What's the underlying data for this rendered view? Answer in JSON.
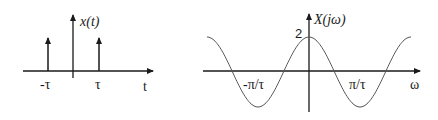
{
  "left_plot": {
    "y_label": "x(t)",
    "x_label": "t",
    "ticks": [
      "-τ",
      "τ"
    ],
    "impulses": [
      {
        "t": "-τ",
        "weight": 1
      },
      {
        "t": "τ",
        "weight": 1
      }
    ]
  },
  "right_plot": {
    "y_label": "X(jω)",
    "x_label": "ω",
    "peak_label": "2",
    "ticks": [
      "-π/τ",
      "π/τ"
    ],
    "function": "2cos(ωτ)"
  },
  "colors": {
    "ink": "#1a1a1a",
    "curve": "#555555"
  }
}
